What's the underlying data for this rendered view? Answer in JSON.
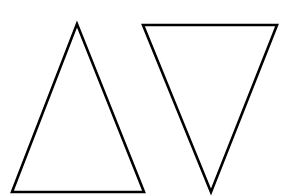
{
  "canvas": {
    "width": 290,
    "height": 196,
    "background": "#ffffff"
  },
  "shapes": [
    {
      "id": "upward-triangle",
      "type": "triangle",
      "orientation": "up",
      "points": [
        [
          77,
          24
        ],
        [
          12,
          192
        ],
        [
          144,
          192
        ]
      ],
      "stroke": "#000000",
      "stroke_width": 2.6,
      "fill": "none"
    },
    {
      "id": "downward-triangle",
      "type": "triangle",
      "orientation": "down",
      "points": [
        [
          143,
          25
        ],
        [
          277,
          25
        ],
        [
          211,
          192
        ]
      ],
      "stroke": "#000000",
      "stroke_width": 2.6,
      "fill": "none"
    }
  ]
}
